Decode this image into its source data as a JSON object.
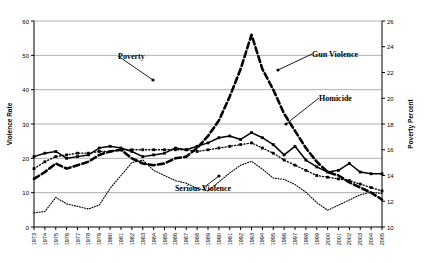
{
  "chart_data": {
    "type": "line",
    "title": "",
    "xlabel": "",
    "ylabel": "Violence Rate",
    "y2label": "Poverty Percent",
    "ylim": [
      0,
      60
    ],
    "y2lim": [
      10,
      26
    ],
    "yticks": [
      0,
      10,
      20,
      30,
      40,
      50,
      60
    ],
    "y2ticks": [
      10,
      12,
      14,
      16,
      18,
      20,
      22,
      24,
      26
    ],
    "grid": true,
    "legend": "inline-annotations",
    "categories": [
      "1973",
      "1974",
      "1975",
      "1976",
      "1977",
      "1978",
      "1979",
      "1980",
      "1981",
      "1982",
      "1983",
      "1984",
      "1985",
      "1986",
      "1987",
      "1988",
      "1989",
      "1990",
      "1991",
      "1992",
      "1993",
      "1994",
      "1995",
      "1996",
      "1997",
      "1998",
      "1999",
      "2000",
      "2001",
      "2002",
      "2003",
      "2004",
      "2005"
    ],
    "series": [
      {
        "name": "Poverty",
        "axis": "right",
        "style": "dotted",
        "values": [
          11.1,
          11.2,
          12.3,
          11.8,
          11.6,
          11.4,
          11.7,
          13.0,
          14.0,
          15.0,
          15.2,
          14.4,
          14.0,
          13.6,
          13.4,
          13.0,
          12.8,
          13.5,
          14.2,
          14.8,
          15.1,
          14.5,
          13.8,
          13.7,
          13.3,
          12.7,
          11.9,
          11.3,
          11.7,
          12.1,
          12.5,
          12.7,
          12.6
        ]
      },
      {
        "name": "Gun Violence",
        "axis": "left",
        "style": "bold-dashed",
        "values": [
          14.0,
          16.0,
          18.5,
          17.0,
          18.0,
          19.0,
          21.0,
          22.0,
          22.5,
          20.0,
          18.5,
          18.0,
          18.5,
          20.0,
          20.5,
          23.0,
          26.5,
          31.0,
          38.0,
          46.0,
          56.0,
          46.0,
          40.0,
          33.0,
          28.0,
          23.0,
          19.0,
          16.0,
          15.0,
          13.0,
          11.5,
          10.0,
          8.0
        ]
      },
      {
        "name": "Homicide",
        "axis": "left",
        "style": "solid-marker",
        "values": [
          20.5,
          21.5,
          22.0,
          20.0,
          20.5,
          21.0,
          23.0,
          23.5,
          23.0,
          22.0,
          20.5,
          21.0,
          21.5,
          23.0,
          22.5,
          23.5,
          24.5,
          26.0,
          26.5,
          25.5,
          27.5,
          26.0,
          24.0,
          21.0,
          23.5,
          19.5,
          17.5,
          16.0,
          16.5,
          18.5,
          16.0,
          15.5,
          15.5
        ]
      },
      {
        "name": "Serious Violence",
        "axis": "left",
        "style": "dotted-marker",
        "values": [
          17.0,
          19.0,
          20.5,
          21.0,
          21.5,
          21.5,
          22.0,
          22.0,
          22.5,
          22.5,
          22.5,
          22.5,
          22.5,
          22.5,
          22.5,
          22.0,
          22.5,
          23.0,
          23.5,
          24.0,
          24.5,
          23.0,
          21.5,
          19.5,
          18.0,
          16.5,
          15.0,
          14.5,
          14.0,
          13.5,
          12.5,
          11.5,
          10.5
        ]
      }
    ],
    "annotations": [
      {
        "text": "Poverty",
        "x": 118,
        "y": 59,
        "arrow_to_x": 153,
        "arrow_to_y": 80
      },
      {
        "text": "Gun Violence",
        "x": 312,
        "y": 57,
        "arrow_to_x": 278,
        "arrow_to_y": 70
      },
      {
        "text": "Homicide",
        "x": 319,
        "y": 101,
        "arrow_to_x": 286,
        "arrow_to_y": 124
      },
      {
        "text": "Serious Violence",
        "x": 203,
        "y": 191,
        "arrow_to_x": 219,
        "arrow_to_y": 176
      }
    ]
  }
}
